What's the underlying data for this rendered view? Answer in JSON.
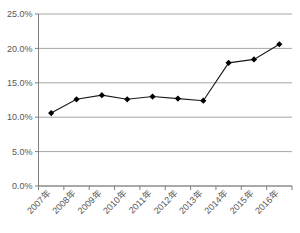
{
  "chart_data": {
    "type": "line",
    "title": "",
    "xlabel": "",
    "ylabel": "",
    "categories": [
      "2007年",
      "2008年",
      "2009年",
      "2010年",
      "2011年",
      "2012年",
      "2013年",
      "2014年",
      "2015年",
      "2016年"
    ],
    "values": [
      10.6,
      12.6,
      13.2,
      12.6,
      13.0,
      12.7,
      12.4,
      17.9,
      18.4,
      20.6
    ],
    "series": [
      {
        "name": "",
        "values": [
          10.6,
          12.6,
          13.2,
          12.6,
          13.0,
          12.7,
          12.4,
          17.9,
          18.4,
          20.6
        ]
      }
    ],
    "ylim": [
      0,
      25
    ],
    "ytick_labels": [
      "0.0%",
      "5.0%",
      "10.0%",
      "15.0%",
      "20.0%",
      "25.0%"
    ],
    "ytick_values": [
      0,
      5,
      10,
      15,
      20,
      25
    ],
    "grid": true,
    "legend": "none",
    "marker": "diamond",
    "line_color": "#1a1a1a",
    "marker_color": "#000000",
    "grid_color": "#a6a6a6",
    "axis_color": "#7f7f7f",
    "label_color": "#58585a",
    "background": "#ffffff",
    "xtick_rotation": -45
  },
  "caption": {
    "text": ""
  }
}
